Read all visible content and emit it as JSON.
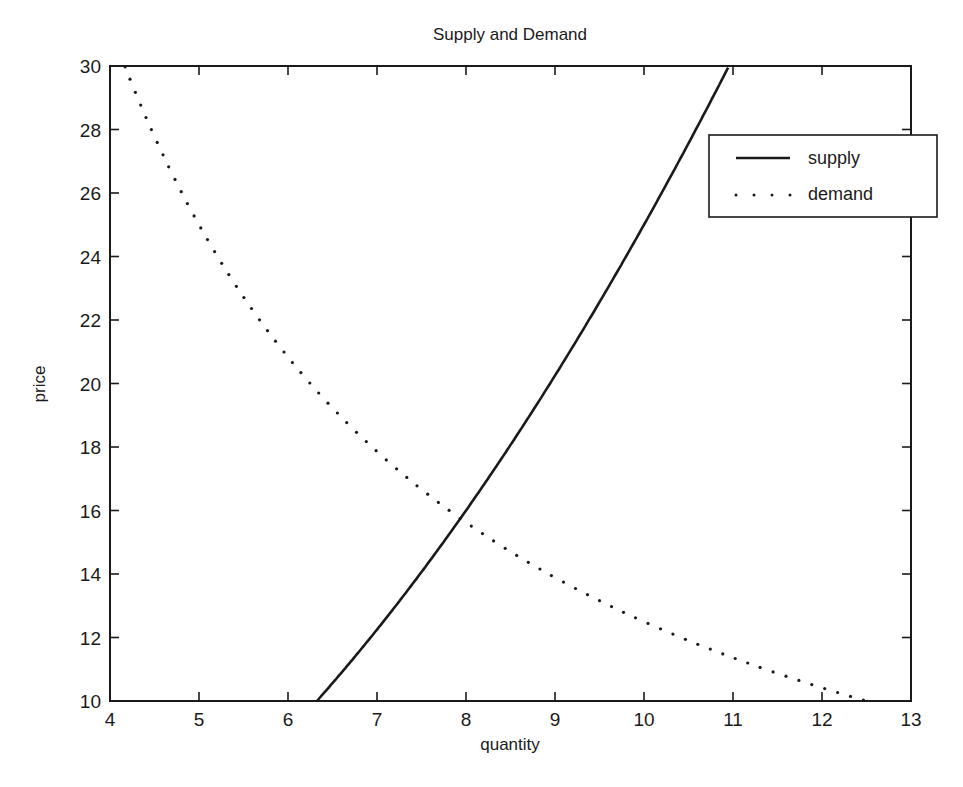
{
  "chart_data": {
    "type": "line",
    "title": "Supply and Demand",
    "xlabel": "quantity",
    "ylabel": "price",
    "xlim": [
      4,
      13
    ],
    "ylim": [
      10,
      30
    ],
    "xticks": [
      4,
      5,
      6,
      7,
      8,
      9,
      10,
      11,
      12,
      13
    ],
    "yticks": [
      10,
      12,
      14,
      16,
      18,
      20,
      22,
      24,
      26,
      28,
      30
    ],
    "grid": false,
    "legend_position": "upper right (outside frame edge)",
    "series": [
      {
        "name": "supply",
        "style": "solid",
        "formula": "price = quantity^2 / 4",
        "x": [
          6.32,
          6.5,
          7,
          7.5,
          8,
          8.5,
          9,
          9.5,
          10,
          10.5,
          10.95
        ],
        "values": [
          10.0,
          10.56,
          12.25,
          14.06,
          16.0,
          18.06,
          20.25,
          22.56,
          25.0,
          27.56,
          30.0
        ]
      },
      {
        "name": "demand",
        "style": "dotted",
        "formula": "price = 125 / quantity",
        "x": [
          4.17,
          4.5,
          5,
          5.5,
          6,
          6.5,
          7,
          7.5,
          8,
          8.5,
          9,
          9.5,
          10,
          10.5,
          11,
          11.5,
          12,
          12.5
        ],
        "values": [
          30.0,
          27.78,
          25.0,
          22.73,
          20.83,
          19.23,
          17.86,
          16.67,
          15.63,
          14.71,
          13.89,
          13.16,
          12.5,
          11.9,
          11.36,
          10.87,
          10.42,
          10.0
        ]
      }
    ],
    "equilibrium_approx": {
      "quantity": 7.94,
      "price": 15.75
    }
  },
  "legend": {
    "items": [
      {
        "label": "supply",
        "style": "solid"
      },
      {
        "label": "demand",
        "style": "dotted"
      }
    ]
  },
  "colors": {
    "ink": "#1a1a1a",
    "background": "#ffffff"
  }
}
